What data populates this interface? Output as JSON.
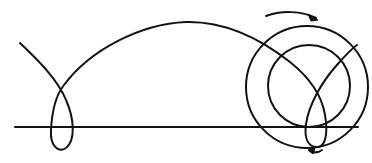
{
  "diagram": {
    "type": "prolate-cycloid-rolling-wheel",
    "stroke_color": "#111111",
    "background": "#ffffff",
    "ground_line": {
      "x1": 15,
      "y1": 127,
      "x2": 358,
      "y2": 127
    },
    "wheel": {
      "center": [
        307,
        87
      ],
      "outer_circle_radius": 61,
      "inner_circle_radius": 41
    },
    "rotation_arrow_top": {
      "direction": "clockwise"
    },
    "rotation_arrow_bottom": {
      "direction": "clockwise"
    },
    "trace_path": {
      "loops": 2,
      "left_loop_crossing": [
        62,
        89
      ],
      "left_loop_bottom": [
        62,
        149
      ],
      "arch_peak": [
        186,
        22
      ]
    }
  }
}
